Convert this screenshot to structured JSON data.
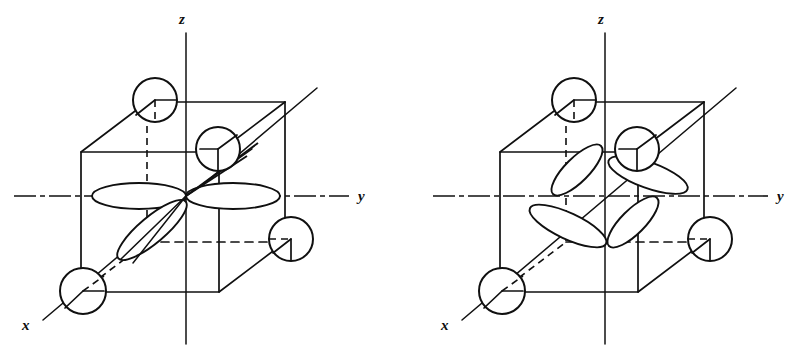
{
  "figure": {
    "title": "",
    "background_color": "#ffffff",
    "ink_color": "#101010",
    "width": 802,
    "height": 354,
    "panel_count": 2
  },
  "panels": [
    {
      "id": "left",
      "name": "d-orbital-in-cube-left",
      "orbital_label": "",
      "origin": {
        "x": 186,
        "y": 196
      },
      "axes": [
        {
          "name": "z",
          "label": "z",
          "label_x": 182,
          "label_y": 24,
          "direction": "up"
        },
        {
          "name": "y",
          "label": "y",
          "label_x": 358,
          "label_y": 201,
          "direction": "right"
        },
        {
          "name": "x",
          "label": "x",
          "label_x": 22,
          "label_y": 330,
          "direction": "down-left"
        }
      ],
      "ligand_spheres": [
        {
          "name": "ligand-top-left",
          "cx": 155,
          "cy": 100,
          "r": 22
        },
        {
          "name": "ligand-center-up",
          "cx": 218,
          "cy": 149,
          "r": 22
        },
        {
          "name": "ligand-right-low",
          "cx": 291,
          "cy": 239,
          "r": 22
        },
        {
          "name": "ligand-bottom-left",
          "cx": 83,
          "cy": 291,
          "r": 23
        }
      ],
      "lobes": [
        {
          "name": "lobe-y-negative",
          "orientation": "horizontal-left"
        },
        {
          "name": "lobe-y-positive",
          "orientation": "horizontal-right"
        },
        {
          "name": "lobe-x-near",
          "orientation": "diagonal-lower-left"
        },
        {
          "name": "lobe-x-far",
          "orientation": "diagonal-upper-right"
        }
      ]
    },
    {
      "id": "right",
      "name": "d-orbital-in-cube-right",
      "orbital_label": "",
      "origin": {
        "x": 605,
        "y": 196
      },
      "axes": [
        {
          "name": "z",
          "label": "z",
          "label_x": 601,
          "label_y": 24,
          "direction": "up"
        },
        {
          "name": "y",
          "label": "y",
          "label_x": 777,
          "label_y": 201,
          "direction": "right"
        },
        {
          "name": "x",
          "label": "x",
          "label_x": 441,
          "label_y": 330,
          "direction": "down-left"
        }
      ],
      "ligand_spheres": [
        {
          "name": "ligand-top-left",
          "cx": 574,
          "cy": 100,
          "r": 22
        },
        {
          "name": "ligand-center-up",
          "cx": 637,
          "cy": 149,
          "r": 22
        },
        {
          "name": "ligand-right-low",
          "cx": 710,
          "cy": 239,
          "r": 22
        },
        {
          "name": "ligand-bottom-left",
          "cx": 502,
          "cy": 291,
          "r": 23
        }
      ],
      "lobes": [
        {
          "name": "lobe-upper-left",
          "orientation": "between-axes-upper-left"
        },
        {
          "name": "lobe-upper-right",
          "orientation": "between-axes-upper-right"
        },
        {
          "name": "lobe-lower-left",
          "orientation": "between-axes-lower-left"
        },
        {
          "name": "lobe-lower-right",
          "orientation": "between-axes-lower-right"
        }
      ]
    }
  ]
}
